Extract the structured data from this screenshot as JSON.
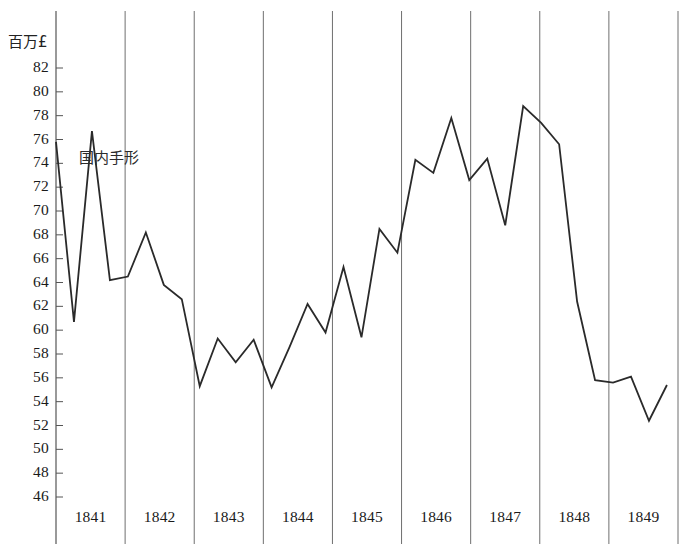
{
  "chart_data": {
    "type": "line",
    "title": "",
    "subtitle": "",
    "unit_label": "百万£",
    "xlabel": "",
    "ylabel": "",
    "ylim": [
      45,
      83
    ],
    "xlim": [
      1841.0,
      1850.0
    ],
    "grid": "vertical-year-boundaries",
    "legend_position": "inline-annotation",
    "y_ticks": [
      82,
      80,
      78,
      76,
      74,
      72,
      70,
      68,
      66,
      64,
      62,
      60,
      58,
      56,
      54,
      52,
      50,
      48,
      46
    ],
    "y_tick_labels": [
      "82",
      "80",
      "78",
      "76",
      "74",
      "72",
      "70",
      "68",
      "66",
      "64",
      "62",
      "60",
      "58",
      "56",
      "54",
      "52",
      "50",
      "48",
      "46"
    ],
    "x_ticks": [
      1841,
      1842,
      1843,
      1844,
      1845,
      1846,
      1847,
      1848,
      1849
    ],
    "x_tick_labels": [
      "1841",
      "1842",
      "1843",
      "1844",
      "1845",
      "1846",
      "1847",
      "1848",
      "1849"
    ],
    "annotations": [
      {
        "text": "国内手形",
        "x": 1841.5,
        "y": 74.6
      }
    ],
    "series": [
      {
        "name": "国内手形",
        "color": "#2a2a2a",
        "x": [
          1841.0,
          1841.26,
          1841.52,
          1841.78,
          1842.04,
          1842.3,
          1842.56,
          1842.82,
          1843.08,
          1843.34,
          1843.6,
          1843.86,
          1844.12,
          1844.38,
          1844.64,
          1844.9,
          1845.16,
          1845.42,
          1845.68,
          1845.94,
          1846.2,
          1846.46,
          1846.72,
          1846.98,
          1847.24,
          1847.5,
          1847.76,
          1848.02,
          1848.28,
          1848.54,
          1848.8,
          1849.06,
          1849.32,
          1849.58,
          1849.84
        ],
        "values": [
          75.8,
          60.7,
          76.7,
          64.2,
          64.5,
          68.2,
          63.8,
          62.6,
          55.3,
          59.3,
          57.3,
          59.2,
          55.2,
          58.6,
          62.2,
          59.8,
          65.3,
          59.4,
          68.5,
          66.5,
          74.3,
          73.2,
          77.8,
          72.6,
          74.4,
          68.8,
          78.8,
          77.4,
          75.6,
          62.4,
          55.8,
          55.6,
          56.1,
          52.4,
          55.4
        ]
      }
    ]
  },
  "axis": {
    "unit_label": "百万£"
  },
  "footer": {
    "note": ""
  }
}
